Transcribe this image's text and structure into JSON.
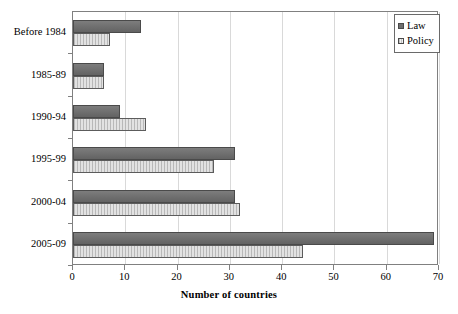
{
  "chart_data": {
    "type": "bar",
    "orientation": "horizontal",
    "title": "",
    "xlabel": "Number of countries",
    "ylabel": "",
    "xlim": [
      0,
      70
    ],
    "xticks": [
      0,
      10,
      20,
      30,
      40,
      50,
      60,
      70
    ],
    "xtick_labels": [
      "0",
      "10",
      "20",
      "30",
      "40",
      "50",
      "60",
      "70"
    ],
    "grid": "vertical",
    "legend_position": "top-right",
    "categories": [
      "Before 1984",
      "1985-89",
      "1990-94",
      "1995-99",
      "2000-04",
      "2005-09"
    ],
    "series": [
      {
        "name": "Law",
        "color": "#6e6e6e",
        "values": [
          13,
          6,
          9,
          31,
          31,
          69
        ]
      },
      {
        "name": "Policy",
        "color": "#e2e2e2",
        "values": [
          7,
          6,
          14,
          27,
          32,
          44
        ]
      }
    ]
  },
  "legend": {
    "items": [
      {
        "label": "Law",
        "swatch": "law"
      },
      {
        "label": "Policy",
        "swatch": "policy"
      }
    ]
  }
}
